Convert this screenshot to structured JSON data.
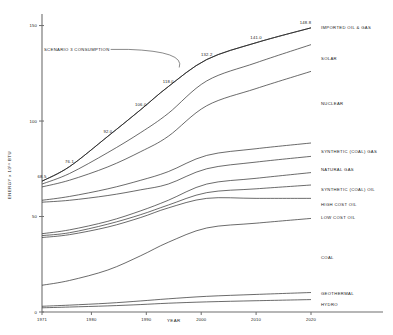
{
  "chart_data": {
    "type": "line",
    "title": "",
    "xlabel": "YEAR",
    "ylabel": "ENERGY x 10^15 BTU",
    "ylabel_display": "ENERGY x 10¹⁵ BTU",
    "x": [
      1971,
      1980,
      1990,
      2000,
      2010,
      2020
    ],
    "xlim": [
      1971,
      2020
    ],
    "ylim": [
      0,
      155
    ],
    "xticks": [
      1971,
      1980,
      1990,
      2000,
      2010,
      2020
    ],
    "xtick_labels": [
      "1971",
      "1980",
      "1990",
      "2000",
      "2010",
      "2020"
    ],
    "yticks": [
      0,
      50,
      100,
      150
    ],
    "ytick_labels": [
      "0",
      "50",
      "100",
      "150"
    ],
    "grid": false,
    "legend_position": "right-inline",
    "annotations": [
      {
        "text": "SCENARIO 3 CONSUMPTION",
        "points_to_year": 1996,
        "points_to_value": 127.0
      }
    ],
    "point_labels": [
      {
        "label": "68.5",
        "x": 1971,
        "y": 68.5
      },
      {
        "label": "76.1",
        "x": 1976,
        "y": 76.1
      },
      {
        "label": "92.0",
        "x": 1983,
        "y": 92.0
      },
      {
        "label": "106.0",
        "x": 1989,
        "y": 106.0
      },
      {
        "label": "118.0",
        "x": 1994,
        "y": 118.0
      },
      {
        "label": "132.2",
        "x": 2001,
        "y": 132.2
      },
      {
        "label": "141.0",
        "x": 2010,
        "y": 141.0
      },
      {
        "label": "148.8",
        "x": 2019,
        "y": 148.8
      }
    ],
    "total_curve": {
      "name": "SCENARIO 3 CONSUMPTION",
      "x": [
        1971,
        1976,
        1983,
        1989,
        1994,
        2001,
        2010,
        2020
      ],
      "values": [
        68.5,
        76.1,
        92.0,
        106.0,
        118.0,
        132.2,
        141.0,
        148.8
      ]
    },
    "series": [
      {
        "name": "IMPORTED OIL & GAS",
        "cumulative_top": [
          68.5,
          76.1,
          92.0,
          106.0,
          118.0,
          132.2,
          141.0,
          148.8
        ]
      },
      {
        "name": "SOLAR",
        "cumulative_top": [
          67.0,
          72.5,
          83.5,
          94.0,
          104.0,
          121.0,
          130.5,
          140.0
        ]
      },
      {
        "name": "NUCLEAR",
        "cumulative_top": [
          65.5,
          69.0,
          76.0,
          84.0,
          92.0,
          108.0,
          117.0,
          126.0
        ]
      },
      {
        "name": "SYNTHETIC (COAL) GAS",
        "cumulative_top": [
          58.5,
          60.5,
          64.5,
          69.0,
          73.5,
          82.0,
          85.5,
          88.5
        ]
      },
      {
        "name": "NATURAL GAS",
        "cumulative_top": [
          57.5,
          58.5,
          61.0,
          64.0,
          67.0,
          75.0,
          78.5,
          81.5
        ]
      },
      {
        "name": "SYNTHETIC (COAL) OIL",
        "cumulative_top": [
          41.0,
          43.0,
          47.5,
          53.0,
          58.5,
          67.0,
          70.0,
          73.0
        ]
      },
      {
        "name": "HIGH COST OIL",
        "cumulative_top": [
          40.0,
          41.5,
          46.0,
          51.0,
          56.0,
          62.5,
          64.5,
          66.5
        ]
      },
      {
        "name": "LOW COST OIL",
        "cumulative_top": [
          39.0,
          40.5,
          44.5,
          49.5,
          54.5,
          59.5,
          59.5,
          59.5
        ]
      },
      {
        "name": "COAL",
        "cumulative_top": [
          14.0,
          16.5,
          22.0,
          29.5,
          36.5,
          44.0,
          46.5,
          49.0
        ]
      },
      {
        "name": "GEOTHERMAL",
        "cumulative_top": [
          3.0,
          3.6,
          4.6,
          5.8,
          6.9,
          8.2,
          9.2,
          10.2
        ]
      },
      {
        "name": "HYDRO",
        "cumulative_top": [
          2.2,
          2.6,
          3.2,
          3.9,
          4.6,
          5.3,
          5.9,
          6.5
        ]
      }
    ],
    "series_labels": [
      {
        "name": "IMPORTED OIL & GAS",
        "label_y": 148.8
      },
      {
        "name": "SOLAR",
        "label_y": 133.0
      },
      {
        "name": "NUCLEAR",
        "label_y": 109.0
      },
      {
        "name": "SYNTHETIC (COAL) GAS",
        "label_y": 84.0
      },
      {
        "name": "NATURAL GAS",
        "label_y": 74.5
      },
      {
        "name": "SYNTHETIC (COAL) OIL",
        "label_y": 64.0
      },
      {
        "name": "HIGH COST OIL",
        "label_y": 56.5
      },
      {
        "name": "LOW COST OIL",
        "label_y": 49.5
      },
      {
        "name": "COAL",
        "label_y": 28.5
      },
      {
        "name": "GEOTHERMAL",
        "label_y": 9.8
      },
      {
        "name": "HYDRO",
        "label_y": 4.0
      }
    ]
  }
}
